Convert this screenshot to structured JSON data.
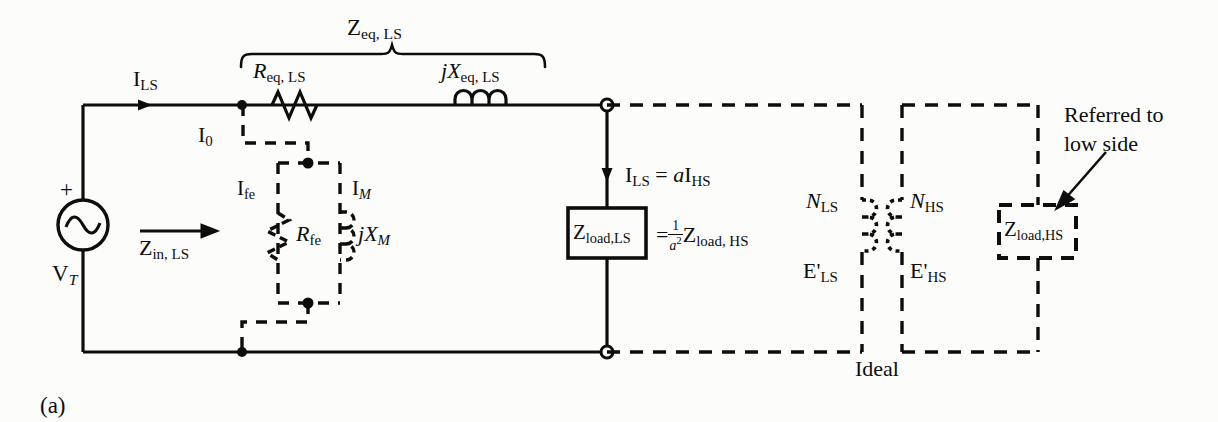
{
  "figure": {
    "caption": "(a)",
    "type": "transformer-equivalent-circuit",
    "ink_color": "#0d0d0d",
    "background_color": "#fcfcfa"
  },
  "labels": {
    "source_voltage": "V",
    "source_voltage_sub": "T",
    "source_polarity": "+",
    "source_icon": "ac-source-sine",
    "line_current": "I",
    "line_current_sub": "LS",
    "exciting_current": "I",
    "exciting_current_sub": "0",
    "input_impedance": "Z",
    "input_impedance_sub": "in, LS",
    "series_impedance_brace": "Z",
    "series_impedance_brace_sub": "eq, LS",
    "series_resistance": "R",
    "series_resistance_sub": "eq, LS",
    "series_reactance_j": "j",
    "series_reactance": "X",
    "series_reactance_sub": "eq, LS",
    "core_loss_current": "I",
    "core_loss_current_sub": "fe",
    "magnetizing_current": "I",
    "magnetizing_current_sub": "M",
    "core_loss_resistance": "R",
    "core_loss_resistance_sub": "fe",
    "magnetizing_reactance_j": "j",
    "magnetizing_reactance": "X",
    "magnetizing_reactance_sub": "M",
    "load_current_eq_lhs": "I",
    "load_current_eq_lhs_sub": "LS",
    "load_current_eq_mid": " = ",
    "load_current_eq_a": "a",
    "load_current_eq_rhs": "I",
    "load_current_eq_rhs_sub": "HS",
    "load_box_ls": "Z",
    "load_box_ls_sub": "load,LS",
    "load_eq_sign": "=",
    "load_eq_frac_num": "1",
    "load_eq_frac_den_a": "a",
    "load_eq_frac_den_exp": "2",
    "load_eq_rhs": "Z",
    "load_eq_rhs_sub": "load, HS",
    "turns_ls": "N",
    "turns_ls_sub": "LS",
    "turns_hs": "N",
    "turns_hs_sub": "HS",
    "emf_ls": "E'",
    "emf_ls_sub": "LS",
    "emf_hs": "E'",
    "emf_hs_sub": "HS",
    "ideal_transformer": "Ideal",
    "load_box_hs": "Z",
    "load_box_hs_sub": "load,HS",
    "annotation_line1": "Referred to",
    "annotation_line2": "low side"
  },
  "icons": {
    "ac_source": "sine-wave-icon",
    "resistor": "resistor-zigzag-icon",
    "inductor": "inductor-coil-icon",
    "junction_dot": "junction-dot-icon",
    "terminal": "open-terminal-circle-icon",
    "current_arrow": "current-arrow-icon",
    "brace": "curly-brace-icon",
    "pointer": "leader-arrow-icon"
  }
}
